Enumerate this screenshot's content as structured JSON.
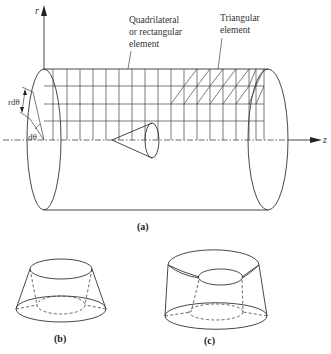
{
  "figure": {
    "panel_a": {
      "caption": "(a)",
      "axis_r_label": "r",
      "axis_z_label": "z",
      "r_dtheta_label": "rdθ",
      "dtheta_label": "dθ",
      "callout_quad_line1": "Quadrilateral",
      "callout_quad_line2": "or rectangular",
      "callout_quad_line3": "element",
      "callout_tri_line1": "Triangular",
      "callout_tri_line2": "element"
    },
    "panel_b": {
      "caption": "(b)",
      "description": "Truncated cone element with dashed hidden inner edges"
    },
    "panel_c": {
      "caption": "(c)",
      "description": "Truncated cone ring element with curved top surface and dashed hidden inner edges"
    },
    "colors": {
      "line": "#333333",
      "background": "#ffffff"
    }
  }
}
